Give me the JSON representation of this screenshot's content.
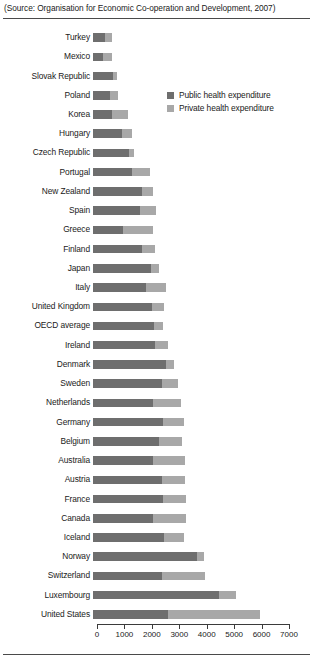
{
  "source": {
    "prefix": "(",
    "label": "Source:",
    "text": " Organisation for Economic Co-operation and Development, 2007)",
    "full": "(Source: Organisation for Economic Co-operation and Development, 2007)"
  },
  "legend": {
    "position": "inside-top-right",
    "items": [
      {
        "label": "Public health expenditure",
        "color": "#6e6e6e",
        "key": "public"
      },
      {
        "label": "Private health expenditure",
        "color": "#a8a8a8",
        "key": "private"
      }
    ]
  },
  "axis": {
    "ticks": [
      0,
      1000,
      2000,
      3000,
      4000,
      5000,
      6000,
      7000
    ],
    "tick_labels": [
      "0",
      "1000",
      "2000",
      "3000",
      "4000",
      "5000",
      "6000",
      "7000"
    ],
    "min": 0,
    "max": 7000
  },
  "chart_data": {
    "type": "bar",
    "orientation": "horizontal",
    "stacked": true,
    "title": "",
    "subtitle": "",
    "xlabel": "",
    "ylabel": "",
    "xlim": [
      0,
      7000
    ],
    "grid": false,
    "legend_position": "inside-top-right",
    "categories": [
      "Turkey",
      "Mexico",
      "Slovak Republic",
      "Poland",
      "Korea",
      "Hungary",
      "Czech Republic",
      "Portugal",
      "New Zealand",
      "Spain",
      "Greece",
      "Finland",
      "Japan",
      "Italy",
      "United Kingdom",
      "OECD average",
      "Ireland",
      "Denmark",
      "Sweden",
      "Netherlands",
      "Germany",
      "Belgium",
      "Australia",
      "Austria",
      "France",
      "Canada",
      "Iceland",
      "Norway",
      "Switzerland",
      "Luxembourg",
      "United States"
    ],
    "series": [
      {
        "name": "Public health expenditure",
        "color": "#6e6e6e",
        "values": [
          430,
          370,
          740,
          620,
          700,
          1040,
          1300,
          1430,
          1800,
          1730,
          1100,
          1800,
          2100,
          1950,
          2150,
          2230,
          2260,
          2660,
          2500,
          2200,
          2550,
          2400,
          2200,
          2500,
          2550,
          2200,
          2600,
          3800,
          2500,
          4600,
          2750
        ]
      },
      {
        "name": "Private health expenditure",
        "color": "#a8a8a8",
        "values": [
          270,
          310,
          150,
          300,
          570,
          400,
          200,
          650,
          400,
          580,
          1100,
          450,
          300,
          700,
          450,
          320,
          480,
          300,
          600,
          1000,
          750,
          850,
          1150,
          850,
          850,
          1200,
          700,
          250,
          1600,
          600,
          3350
        ]
      }
    ],
    "totals": [
      700,
      680,
      890,
      920,
      1270,
      1440,
      1500,
      2080,
      2200,
      2310,
      2200,
      2250,
      2400,
      2650,
      2600,
      2550,
      2740,
      2960,
      3100,
      3200,
      3300,
      3250,
      3350,
      3350,
      3400,
      3400,
      3300,
      4050,
      4100,
      5200,
      6100
    ]
  }
}
